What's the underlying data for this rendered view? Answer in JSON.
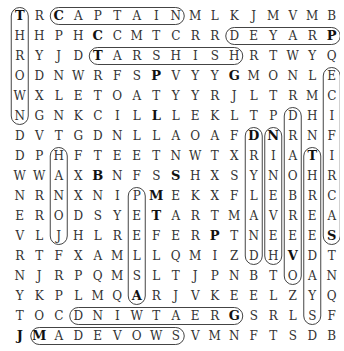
{
  "puzzle": {
    "type": "word-search",
    "rows": 17,
    "cols": 17,
    "grid": [
      "TRCAPTAINMLKJMVMB",
      "HHPHCCMTCRRDEYARP",
      "RYJDTARSHISHRTWYQ",
      "ODNWRFSPVYYGMONLE",
      "WXLETOATYYRJLTRMC",
      "NGNKCILLLEKLTPDHI",
      "DVTGDNLLAOAFDNRNF",
      "DPHFTEETNWTXRIATI",
      "WWAXBNFSSHXSYNOHR",
      "NRNXNIPMEKXFLEBRC",
      "EROD SYETARTMAVREA",
      "VLJHLREFERPTNEEES",
      "RTFXAMLLQMIZDHVDT",
      "NJRPQMSLTJPNBTOAN",
      "YKPLMQARJVKEELZYQ",
      "TOCDNIWTAERGSRLSF",
      "JMADEVOWSVMNFTSDB"
    ],
    "found_words": [
      {
        "word": "THROWN",
        "start": [
          0,
          0
        ],
        "end": [
          5,
          0
        ]
      },
      {
        "word": "CAPTAIN",
        "start": [
          0,
          2
        ],
        "end": [
          0,
          8
        ]
      },
      {
        "word": "PRAYED",
        "start": [
          1,
          16
        ],
        "end": [
          1,
          11
        ]
      },
      {
        "word": "TARSHISH",
        "start": [
          2,
          4
        ],
        "end": [
          2,
          11
        ]
      },
      {
        "word": "SACRIFICE",
        "start": [
          11,
          16
        ],
        "end": [
          3,
          16
        ]
      },
      {
        "word": "DRYLAND",
        "start": [
          6,
          12
        ],
        "end": [
          12,
          12
        ]
      },
      {
        "word": "NINEVEH",
        "start": [
          6,
          13
        ],
        "end": [
          12,
          13
        ]
      },
      {
        "word": "OVERBOARD",
        "start": [
          13,
          14
        ],
        "end": [
          5,
          14
        ]
      },
      {
        "word": "THREEDAYS",
        "start": [
          7,
          15
        ],
        "end": [
          15,
          15
        ]
      },
      {
        "word": "JONAH",
        "start": [
          11,
          2
        ],
        "end": [
          7,
          2
        ]
      },
      {
        "word": "PELLAN",
        "start": [
          9,
          6
        ],
        "end": [
          14,
          6
        ]
      },
      {
        "word": "MADEVOWS",
        "start": [
          16,
          1
        ],
        "end": [
          16,
          8
        ]
      },
      {
        "word": "GREATWIND",
        "start": [
          15,
          11
        ],
        "end": [
          15,
          3
        ]
      }
    ],
    "bold_letters": [
      [
        0,
        0
      ],
      [
        0,
        2
      ],
      [
        1,
        4
      ],
      [
        1,
        16
      ],
      [
        2,
        4
      ],
      [
        3,
        7
      ],
      [
        3,
        11
      ],
      [
        5,
        7
      ],
      [
        6,
        12
      ],
      [
        6,
        13
      ],
      [
        7,
        15
      ],
      [
        8,
        4
      ],
      [
        8,
        8
      ],
      [
        9,
        7
      ],
      [
        10,
        7
      ],
      [
        11,
        10
      ],
      [
        11,
        16
      ],
      [
        12,
        14
      ],
      [
        14,
        6
      ],
      [
        15,
        11
      ],
      [
        16,
        0
      ],
      [
        16,
        1
      ]
    ]
  }
}
